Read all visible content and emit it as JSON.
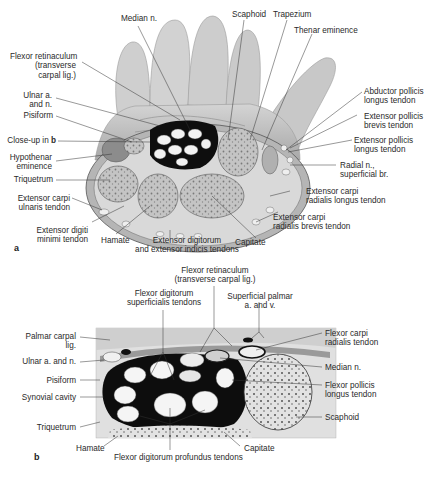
{
  "figure": {
    "panel_a": {
      "panel_label": "a",
      "labels": {
        "median_n": "Median n.",
        "scaphoid": "Scaphoid",
        "trapezium": "Trapezium",
        "thenar_eminence": "Thenar eminence",
        "flexor_retinaculum_1": "Flexor retinaculum",
        "flexor_retinaculum_2": "(transverse",
        "flexor_retinaculum_3": "carpal lig.)",
        "ulnar_an_1": "Ulnar a.",
        "ulnar_an_2": "and n.",
        "pisiform": "Pisiform",
        "closeup_prefix": "Close-up in ",
        "closeup_ref": "b",
        "hypothenar_1": "Hypothenar",
        "hypothenar_2": "eminence",
        "triquetrum": "Triquetrum",
        "ecu_1": "Extensor carpi",
        "ecu_2": "ulnaris tendon",
        "edm_1": "Extensor digiti",
        "edm_2": "minimi tendon",
        "hamate": "Hamate",
        "ed_1": "Extensor digitorum",
        "ed_2": "and extensor indicis tendons",
        "capitate": "Capitate",
        "ecrb_1": "Extensor carpi",
        "ecrb_2": "radialis brevis tendon",
        "ecrl_1": "Extensor carpi",
        "ecrl_2": "radialis longus tendon",
        "radial_n_1": "Radial n.,",
        "radial_n_2": "superficial br.",
        "epl_1": "Extensor pollicis",
        "epl_2": "longus tendon",
        "epb_1": "Extensor pollicis",
        "epb_2": "brevis tendon",
        "apl_1": "Abductor pollicis",
        "apl_2": "longus tendon"
      }
    },
    "panel_b": {
      "panel_label": "b",
      "labels": {
        "fr_1": "Flexor retinaculum",
        "fr_2": "(transverse carpal lig.)",
        "fds_1": "Flexor digitorum",
        "fds_2": "superficialis tendons",
        "spav_1": "Superficial palmar",
        "spav_2": "a. and v.",
        "pcl_1": "Palmar carpal",
        "pcl_2": "lig.",
        "ulnar_an": "Ulnar a. and n.",
        "pisiform": "Pisiform",
        "synovial": "Synovial cavity",
        "triquetrum": "Triquetrum",
        "hamate": "Hamate",
        "fdp": "Flexor digitorum profundus tendons",
        "capitate": "Capitate",
        "scaphoid": "Scaphoid",
        "fpl_1": "Flexor pollicis",
        "fpl_2": "longus tendon",
        "median_n": "Median n.",
        "fcr_1": "Flexor carpi",
        "fcr_2": "radialis tendon"
      }
    },
    "colors": {
      "skin": "#c9c9c9",
      "bone": "#bdbdbd",
      "sheath": "#111111",
      "tendon": "#f4f4f4",
      "soft": "#dedede"
    }
  }
}
